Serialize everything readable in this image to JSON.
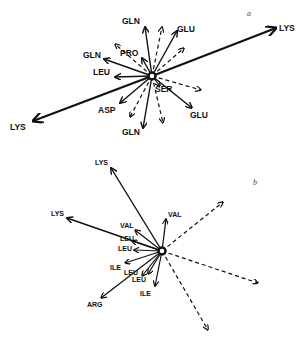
{
  "panel_a": {
    "label": "a",
    "center": [
      152,
      76
    ],
    "vectors": [
      {
        "name": "LYS",
        "to": [
          276,
          28
        ],
        "style": "solid",
        "width": 2.2,
        "label_pos": [
          279,
          31
        ]
      },
      {
        "name": "LYS",
        "to": [
          33,
          121
        ],
        "style": "solid",
        "width": 2.2,
        "label_pos": [
          10,
          130
        ]
      },
      {
        "name": "GLN",
        "to": [
          145,
          27
        ],
        "style": "solid",
        "width": 1.4,
        "label_pos": [
          122,
          24
        ]
      },
      {
        "name": "",
        "to": [
          162,
          27
        ],
        "style": "dashed",
        "width": 1.2
      },
      {
        "name": "GLU",
        "to": [
          177,
          31
        ],
        "style": "solid",
        "width": 1.4,
        "label_pos": [
          177,
          32
        ]
      },
      {
        "name": "",
        "to": [
          184,
          48
        ],
        "style": "dashed",
        "width": 1.2
      },
      {
        "name": "PRO",
        "to": [
          142,
          58
        ],
        "style": "solid",
        "width": 1.4,
        "label_pos": [
          120,
          56
        ]
      },
      {
        "name": "",
        "to": [
          115,
          44
        ],
        "style": "dashed",
        "width": 1.2
      },
      {
        "name": "GLN",
        "to": [
          104,
          59
        ],
        "style": "solid",
        "width": 1.4,
        "label_pos": [
          83,
          58
        ]
      },
      {
        "name": "LEU",
        "to": [
          115,
          77
        ],
        "style": "solid",
        "width": 1.4,
        "label_pos": [
          93,
          75
        ]
      },
      {
        "name": "SER",
        "to": [
          160,
          86
        ],
        "style": "solid",
        "width": 1.2,
        "label_pos": [
          155,
          92
        ]
      },
      {
        "name": "",
        "to": [
          201,
          90
        ],
        "style": "dashed",
        "width": 1.2
      },
      {
        "name": "GLU",
        "to": [
          192,
          108
        ],
        "style": "solid",
        "width": 1.4,
        "label_pos": [
          190,
          118
        ]
      },
      {
        "name": "ASP",
        "to": [
          120,
          103
        ],
        "style": "solid",
        "width": 1.4,
        "label_pos": [
          98,
          113
        ]
      },
      {
        "name": "",
        "to": [
          130,
          117
        ],
        "style": "dashed",
        "width": 1.2
      },
      {
        "name": "GLN",
        "to": [
          143,
          128
        ],
        "style": "solid",
        "width": 1.4,
        "label_pos": [
          122,
          135
        ]
      },
      {
        "name": "",
        "to": [
          163,
          123
        ],
        "style": "dashed",
        "width": 1.2
      }
    ]
  },
  "panel_b": {
    "label": "b",
    "center": [
      162,
      251
    ],
    "vectors": [
      {
        "name": "LYS",
        "to": [
          111,
          168
        ],
        "style": "solid",
        "width": 1.4,
        "label_pos": [
          95,
          165
        ]
      },
      {
        "name": "LYS",
        "to": [
          67,
          218
        ],
        "style": "solid",
        "width": 1.4,
        "label_pos": [
          51,
          216
        ]
      },
      {
        "name": "VAL",
        "to": [
          135,
          230
        ],
        "style": "solid",
        "width": 1.2,
        "label_pos": [
          120,
          228
        ]
      },
      {
        "name": "LEU",
        "to": [
          132,
          241
        ],
        "style": "solid",
        "width": 1.2,
        "label_pos": [
          120,
          241
        ]
      },
      {
        "name": "LEU",
        "to": [
          134,
          250
        ],
        "style": "solid",
        "width": 1.2,
        "label_pos": [
          118,
          251
        ]
      },
      {
        "name": "ILE",
        "to": [
          125,
          263
        ],
        "style": "solid",
        "width": 1.2,
        "label_pos": [
          110,
          270
        ]
      },
      {
        "name": "LEU",
        "to": [
          142,
          276
        ],
        "style": "solid",
        "width": 1.2,
        "label_pos": [
          124,
          275
        ]
      },
      {
        "name": "LEU",
        "to": [
          148,
          274
        ],
        "style": "solid",
        "width": 1.2,
        "label_pos": [
          132,
          282
        ]
      },
      {
        "name": "ILE",
        "to": [
          155,
          286
        ],
        "style": "solid",
        "width": 1.2,
        "label_pos": [
          140,
          296
        ]
      },
      {
        "name": "ARG",
        "to": [
          101,
          298
        ],
        "style": "solid",
        "width": 1.2,
        "label_pos": [
          87,
          307
        ]
      },
      {
        "name": "VAL",
        "to": [
          166,
          219
        ],
        "style": "solid",
        "width": 1.2,
        "label_pos": [
          168,
          217
        ]
      },
      {
        "name": "",
        "to": [
          223,
          202
        ],
        "style": "dashed",
        "width": 1.2
      },
      {
        "name": "",
        "to": [
          258,
          283
        ],
        "style": "dashed",
        "width": 1.2
      },
      {
        "name": "",
        "to": [
          208,
          330
        ],
        "style": "dashed",
        "width": 1.2
      }
    ]
  },
  "panel_labels": [
    {
      "text": "a",
      "pos": [
        247,
        16
      ]
    },
    {
      "text": "b",
      "pos": [
        253,
        185
      ]
    }
  ],
  "colors": {
    "ink": "#111111",
    "background": "#ffffff"
  }
}
